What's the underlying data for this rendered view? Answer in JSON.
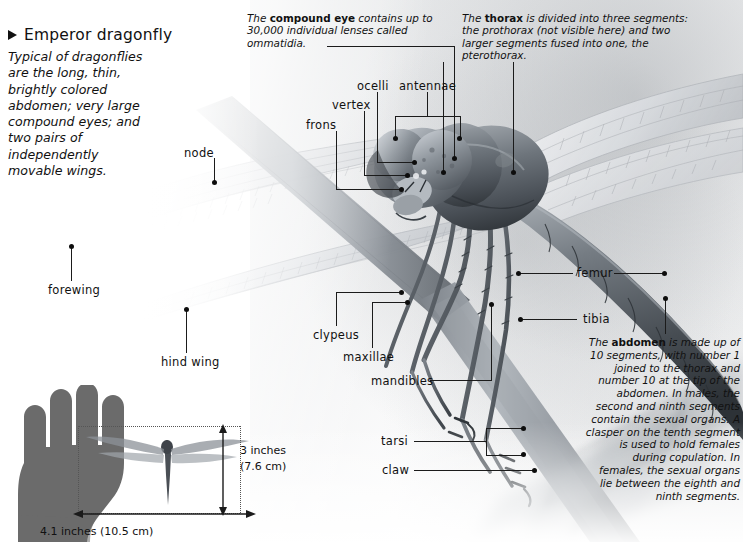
{
  "title_block": {
    "marker_icon": "triangle-right-icon",
    "title": "Emperor dragonfly",
    "description": "Typical of dragonflies are the long, thin, brightly colored abdomen; very large compound eyes; and two pairs of independently movable wings."
  },
  "callouts": {
    "compound_eye": {
      "lead_in": "The ",
      "term": "compound eye",
      "body": " contains up to 30,000 individual lenses called ommatidia."
    },
    "thorax": {
      "lead_in": "The ",
      "term": "thorax",
      "body": " is divided into three segments: the prothorax (not visible here) and two larger segments fused into one, the pterothorax."
    },
    "abdomen": {
      "lead_in": "The ",
      "term": "abdomen",
      "body": " is made up of 10 segments, with number 1 joined to the thorax and number 10 at the tip of the abdomen. In males, the second and ninth segments contain the sexual organs. A clasper on the tenth segment is used to hold females during copulation. In females, the sexual organs lie between the eighth and ninth segments."
    }
  },
  "labels": {
    "node": "node",
    "frons": "frons",
    "vertex": "vertex",
    "ocelli": "ocelli",
    "antennae": "antennae",
    "forewing": "forewing",
    "hind_wing": "hind wing",
    "clypeus": "clypeus",
    "maxillae": "maxillae",
    "mandibles": "mandibles",
    "femur": "femur",
    "tibia": "tibia",
    "tarsi": "tarsi",
    "claw": "claw"
  },
  "scale_diagram": {
    "hand_icon": "hand-silhouette-icon",
    "dragonfly_icon": "dragonfly-silhouette-icon",
    "height_label_line1": "3 inches",
    "height_label_line2": "(7.6 cm)",
    "width_label": "4.1 inches (10.5 cm)"
  },
  "colors": {
    "text": "#111111",
    "leader": "#1b1b1b",
    "hand_fill": "#6b6b6b",
    "dotted_guide": "#555555"
  }
}
